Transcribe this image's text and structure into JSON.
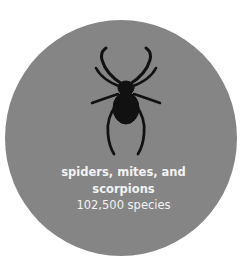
{
  "card": {
    "background_color": "#858585",
    "icon": "spider-icon",
    "title_line1": "spiders, mites, and",
    "title_line2": "scorpions",
    "species_count": "102,500 species"
  }
}
